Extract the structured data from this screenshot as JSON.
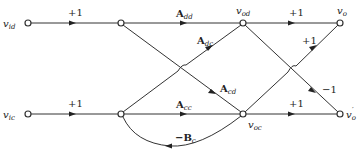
{
  "diagram": {
    "type": "signal-flow-graph",
    "nodes": [
      {
        "id": "vid",
        "label": "v",
        "sub": "id",
        "x": 28,
        "y": 23
      },
      {
        "id": "n1",
        "label": "",
        "x": 121,
        "y": 23
      },
      {
        "id": "vod",
        "label": "v",
        "sub": "od",
        "x": 243,
        "y": 23
      },
      {
        "id": "vo",
        "label": "v",
        "sub": "o",
        "x": 340,
        "y": 23
      },
      {
        "id": "vic",
        "label": "v",
        "sub": "ic",
        "x": 28,
        "y": 114
      },
      {
        "id": "n2",
        "label": "",
        "x": 121,
        "y": 114
      },
      {
        "id": "voc",
        "label": "v",
        "sub": "oc",
        "x": 243,
        "y": 114
      },
      {
        "id": "vo_prime",
        "label": "v",
        "sub": "o",
        "prime": "′",
        "x": 340,
        "y": 114
      }
    ],
    "edges": [
      {
        "from": "vid",
        "to": "n1",
        "gain": "+1"
      },
      {
        "from": "n1",
        "to": "vod",
        "gain": "A",
        "gain_sub": "dd"
      },
      {
        "from": "vod",
        "to": "vo",
        "gain": "+1"
      },
      {
        "from": "n2",
        "to": "vod",
        "gain": "A",
        "gain_sub": "dc"
      },
      {
        "from": "n1",
        "to": "voc",
        "gain": "A",
        "gain_sub": "cd"
      },
      {
        "from": "vic",
        "to": "n2",
        "gain": "+1"
      },
      {
        "from": "n2",
        "to": "voc",
        "gain": "A",
        "gain_sub": "cc"
      },
      {
        "from": "voc",
        "to": "vo_prime",
        "gain": "+1"
      },
      {
        "from": "voc",
        "to": "vo",
        "gain": "+1"
      },
      {
        "from": "vod",
        "to": "vo_prime",
        "gain": "−1"
      },
      {
        "from": "voc",
        "to": "n2",
        "gain": "−B",
        "gain_sub": "c"
      }
    ],
    "labels": {
      "vid": "v",
      "vid_sub": "id",
      "vic": "v",
      "vic_sub": "ic",
      "vod": "v",
      "vod_sub": "od",
      "voc": "v",
      "voc_sub": "oc",
      "vo": "v",
      "vo_sub": "o",
      "vo_prime": "v",
      "vo_prime_sub": "o",
      "prime": "′",
      "g_vid_n1": "+1",
      "g_vic_n2": "+1",
      "g_add": "A",
      "g_add_sub": "dd",
      "g_adc": "A",
      "g_adc_sub": "dc",
      "g_acd": "A",
      "g_acd_sub": "cd",
      "g_acc": "A",
      "g_acc_sub": "cc",
      "g_vod_vo": "+1",
      "g_voc_vo": "+1",
      "g_voc_vop": "+1",
      "g_vod_vop": "−1",
      "g_bc": "−B",
      "g_bc_sub": "c"
    }
  }
}
